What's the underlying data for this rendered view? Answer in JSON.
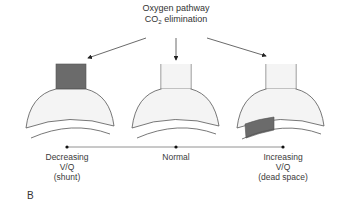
{
  "header": {
    "line1": "Oxygen pathway",
    "line2_prefix": "CO",
    "line2_sub": "2",
    "line2_suffix": " elimination"
  },
  "units": [
    {
      "id": "shunt",
      "label_lines": [
        "Decreasing",
        "V/Q",
        "(shunt)"
      ],
      "shaded_region": "airway"
    },
    {
      "id": "normal",
      "label_lines": [
        "Normal"
      ],
      "shaded_region": "none"
    },
    {
      "id": "dead-space",
      "label_lines": [
        "Increasing",
        "V/Q",
        "(dead space)"
      ],
      "shaded_region": "capillary"
    }
  ],
  "panel_label": "B",
  "colors": {
    "shade": "#6b6b6b",
    "alveolus_fill": "#f4f4f4",
    "stroke": "#555555"
  }
}
